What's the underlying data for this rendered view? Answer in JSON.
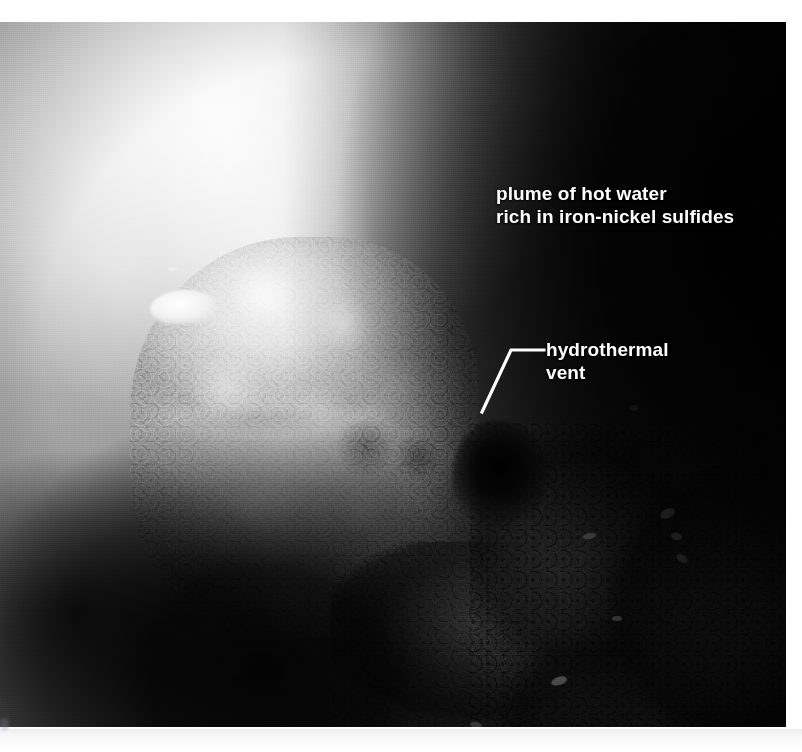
{
  "figure": {
    "kind": "annotated-photograph",
    "palette": {
      "label_text": "#ffffff",
      "leader_line": "#ffffff",
      "page_background": "#ffffff",
      "photo_darkest": "#000000",
      "photo_brightest": "#f4f4f4"
    }
  },
  "annotations": {
    "plume": {
      "line1": "plume of hot water",
      "line2": "rich in iron-nickel sulfides"
    },
    "vent": {
      "line1": "hydrothermal",
      "line2": "vent"
    }
  }
}
